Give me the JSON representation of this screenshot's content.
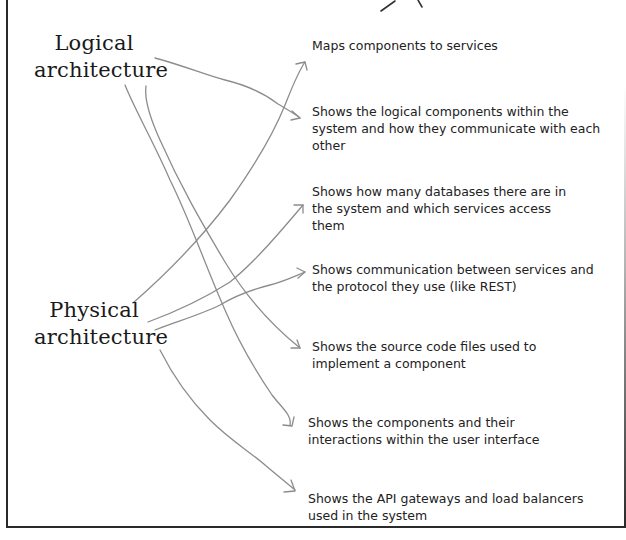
{
  "labels": {
    "logical": {
      "line1": "Logical",
      "line2": "architecture"
    },
    "physical": {
      "line1": "Physical",
      "line2": "architecture"
    }
  },
  "descriptions": [
    {
      "text": "Maps components to services"
    },
    {
      "text": "Shows the logical components within the system and how they communicate with each other"
    },
    {
      "text": "Shows how many databases there are in the system and which services access them"
    },
    {
      "text": "Shows communication between services and the protocol they use (like REST)"
    },
    {
      "text": "Shows the source code files used to implement a component"
    },
    {
      "text": "Shows the components and their interactions within the user interface"
    },
    {
      "text": "Shows the API gateways and load balancers used in the system"
    }
  ],
  "connections": [
    {
      "from": "Logical architecture",
      "to": "Shows the logical components within the system and how they communicate with each other"
    },
    {
      "from": "Logical architecture",
      "to": "Shows the source code files used to implement a component"
    },
    {
      "from": "Logical architecture",
      "to": "Shows the components and their interactions within the user interface"
    },
    {
      "from": "Physical architecture",
      "to": "Maps components to services"
    },
    {
      "from": "Physical architecture",
      "to": "Shows how many databases there are in the system and which services access them"
    },
    {
      "from": "Physical architecture",
      "to": "Shows communication between services and the protocol they use (like REST)"
    },
    {
      "from": "Physical architecture",
      "to": "Shows the API gateways and load balancers used in the system"
    }
  ],
  "colors": {
    "arrow": "#8c8c8c",
    "frame": "#2a2a2a",
    "text": "#222222"
  }
}
